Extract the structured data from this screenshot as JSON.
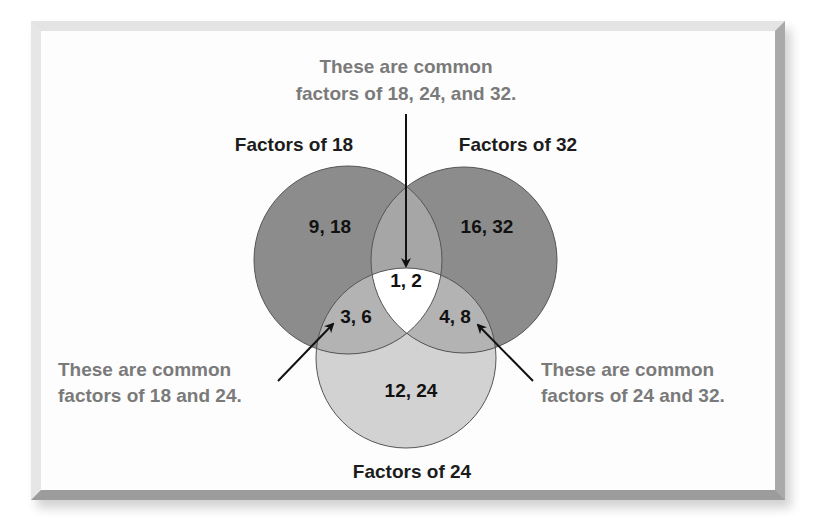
{
  "diagram": {
    "type": "venn",
    "sets": [
      {
        "id": "A",
        "label": "Factors of 18"
      },
      {
        "id": "B",
        "label": "Factors of 32"
      },
      {
        "id": "C",
        "label": "Factors of 24"
      }
    ],
    "regions": {
      "only_18": "9, 18",
      "only_32": "16, 32",
      "only_24": "12, 24",
      "all_three": "1, 2",
      "18_and_24": "3, 6",
      "24_and_32": "4, 8"
    },
    "annotations": {
      "top": {
        "line1": "These are common",
        "line2": "factors of 18, 24, and 32."
      },
      "left": {
        "line1": "These are common",
        "line2": "factors of 18 and 24."
      },
      "right": {
        "line1": "These are common",
        "line2": "factors of 24 and 32."
      }
    },
    "colors": {
      "circle_top": "#8c8c8c",
      "overlap_top": "#a6a6a6",
      "circle_bottom": "#d2d2d2",
      "overlap_bottom": "#b3b3b3",
      "center": "#ffffff",
      "outline": "#555555",
      "annotation_text": "#7a7a7a"
    }
  }
}
